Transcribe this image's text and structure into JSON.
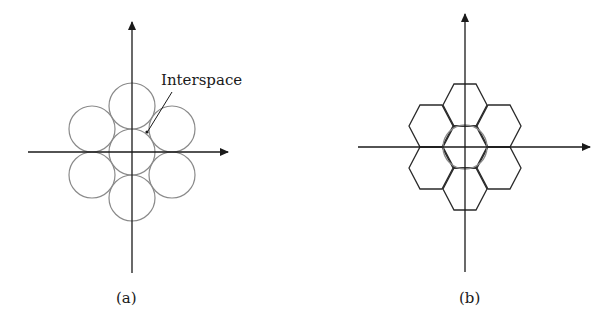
{
  "figure": {
    "panels": [
      {
        "id": "a",
        "caption": "(a)",
        "description": "Seven circles in hexagonal close packing around origin",
        "annotation": "Interspace",
        "shape": "circle",
        "count": 7
      },
      {
        "id": "b",
        "caption": "(b)",
        "description": "Seven hexagons tiling around origin with central inscribed circle",
        "shape": "hexagon",
        "count": 7
      }
    ],
    "colors": {
      "axis": "#1a1a1a",
      "circle_stroke": "#8a8a8a",
      "hexagon_stroke": "#2a2a2a"
    }
  }
}
